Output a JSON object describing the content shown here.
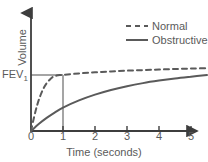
{
  "chart_data": {
    "type": "line",
    "title": "",
    "xlabel": "Time (seconds)",
    "ylabel": "Volume",
    "xlim": [
      0,
      5.5
    ],
    "ylim": [
      0,
      1.15
    ],
    "xticks": [
      "0",
      "1",
      "2",
      "3",
      "4",
      "5"
    ],
    "xtick_values": [
      0,
      1,
      2,
      3,
      4,
      5
    ],
    "yticks": [
      "FEV1"
    ],
    "grid": false,
    "legend_position": "top-right",
    "annotations": {
      "fev1_label": "FEV",
      "fev1_subscript": "1",
      "fev1_level": 0.78,
      "fev1_time": 1
    },
    "series": [
      {
        "name": "Normal",
        "style": "dashed",
        "color": "#5a5a5a",
        "x": [
          0,
          0.1,
          0.2,
          0.3,
          0.4,
          0.5,
          0.6,
          0.7,
          0.8,
          0.9,
          1.0,
          1.5,
          2.0,
          2.5,
          3.0,
          3.5,
          4.0,
          4.5,
          5.0,
          5.5
        ],
        "y": [
          0,
          0.2,
          0.37,
          0.5,
          0.6,
          0.67,
          0.72,
          0.755,
          0.77,
          0.777,
          0.78,
          0.8,
          0.815,
          0.827,
          0.838,
          0.846,
          0.854,
          0.861,
          0.867,
          0.872
        ]
      },
      {
        "name": "Obstructive",
        "style": "solid",
        "color": "#5a5a5a",
        "x": [
          0,
          0.25,
          0.5,
          0.75,
          1.0,
          1.5,
          2.0,
          2.5,
          3.0,
          3.5,
          4.0,
          4.5,
          5.0,
          5.5
        ],
        "y": [
          0,
          0.1,
          0.185,
          0.26,
          0.325,
          0.425,
          0.505,
          0.57,
          0.622,
          0.665,
          0.7,
          0.73,
          0.755,
          0.778
        ]
      }
    ]
  },
  "legend": {
    "items": [
      {
        "label": "Normal",
        "style": "dashed"
      },
      {
        "label": "Obstructive",
        "style": "solid"
      }
    ]
  },
  "axes": {
    "x_title": "Time (seconds)",
    "y_title": "Volume",
    "x_tick_labels": [
      "0",
      "1",
      "2",
      "3",
      "4",
      "5"
    ]
  },
  "colors": {
    "line": "#5a5a5a",
    "axis": "#3d3d3d",
    "guide": "#8f8f8f",
    "text": "#5a5a5a",
    "background": "#ffffff"
  }
}
